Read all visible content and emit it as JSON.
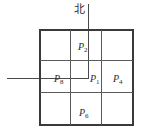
{
  "diagram": {
    "title_glyph": "北",
    "north_label": "北",
    "grid": {
      "rows": 3,
      "columns": 3
    },
    "cells": [
      {
        "id": "p2",
        "base": "P",
        "subscript": "2",
        "position": "top-center"
      },
      {
        "id": "p8",
        "base": "P",
        "subscript": "8",
        "position": "middle-left"
      },
      {
        "id": "p1",
        "base": "P",
        "subscript": "1",
        "position": "middle-center"
      },
      {
        "id": "p4",
        "base": "P",
        "subscript": "4",
        "position": "middle-right"
      },
      {
        "id": "p6",
        "base": "P",
        "subscript": "6",
        "position": "bottom-center"
      }
    ],
    "axes": {
      "vertical_name": "north-axis",
      "horizontal_name": "west-axis"
    },
    "colors": {
      "frame": "#3a3a3a",
      "gridline": "#5a5a5a",
      "axis": "#4a4a4a",
      "text": "#2b2b2b",
      "background": "#ffffff"
    }
  }
}
